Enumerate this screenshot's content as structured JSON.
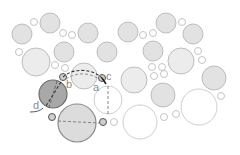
{
  "diagram": {
    "background": "#ffffff",
    "colors": {
      "shaded_fill": "#e2e2e2",
      "shaded_stroke": "#bdbdbd",
      "light_fill": "#ececec",
      "white_fill": "#ffffff",
      "white_stroke": "#cfcfcf",
      "small_stroke": "#c4c4c4",
      "dark_fill": "#a8a8a8",
      "dark_stroke": "#6e6e6e",
      "mid_fill": "#dcdcdc",
      "mid_stroke": "#8c8c8c",
      "path": "#333333"
    },
    "circles": [
      {
        "cx": 22,
        "cy": 34,
        "r": 10,
        "style": "shaded"
      },
      {
        "cx": 50,
        "cy": 23,
        "r": 10,
        "style": "shaded"
      },
      {
        "cx": 88,
        "cy": 33,
        "r": 10,
        "style": "shaded"
      },
      {
        "cx": 128,
        "cy": 32,
        "r": 10,
        "style": "shaded"
      },
      {
        "cx": 166,
        "cy": 23,
        "r": 10,
        "style": "shaded"
      },
      {
        "cx": 193,
        "cy": 34,
        "r": 10,
        "style": "shaded"
      },
      {
        "cx": 64,
        "cy": 52,
        "r": 10,
        "style": "shaded"
      },
      {
        "cx": 107,
        "cy": 52,
        "r": 10,
        "style": "shaded"
      },
      {
        "cx": 153,
        "cy": 51,
        "r": 10,
        "style": "shaded"
      },
      {
        "cx": 214,
        "cy": 78,
        "r": 12,
        "style": "shaded"
      },
      {
        "cx": 163,
        "cy": 95,
        "r": 12,
        "style": "shaded"
      },
      {
        "cx": 36,
        "cy": 62,
        "r": 14,
        "style": "light"
      },
      {
        "cx": 84,
        "cy": 76,
        "r": 13,
        "style": "light"
      },
      {
        "cx": 134,
        "cy": 80,
        "r": 13,
        "style": "light"
      },
      {
        "cx": 181,
        "cy": 61,
        "r": 13,
        "style": "light"
      },
      {
        "cx": 108,
        "cy": 100,
        "r": 14,
        "style": "white"
      },
      {
        "cx": 140,
        "cy": 122,
        "r": 17,
        "style": "white"
      },
      {
        "cx": 199,
        "cy": 107,
        "r": 18,
        "style": "white"
      },
      {
        "cx": 34,
        "cy": 22,
        "r": 3.5,
        "style": "small"
      },
      {
        "cx": 19,
        "cy": 52,
        "r": 3.5,
        "style": "small"
      },
      {
        "cx": 63,
        "cy": 33,
        "r": 3.5,
        "style": "small"
      },
      {
        "cx": 72,
        "cy": 35,
        "r": 3.5,
        "style": "small"
      },
      {
        "cx": 55,
        "cy": 65,
        "r": 3.5,
        "style": "small"
      },
      {
        "cx": 65,
        "cy": 68,
        "r": 3.5,
        "style": "small"
      },
      {
        "cx": 143,
        "cy": 35,
        "r": 3.5,
        "style": "small"
      },
      {
        "cx": 153,
        "cy": 33,
        "r": 3.5,
        "style": "small"
      },
      {
        "cx": 182,
        "cy": 22,
        "r": 3.5,
        "style": "small"
      },
      {
        "cx": 198,
        "cy": 51,
        "r": 3.5,
        "style": "small"
      },
      {
        "cx": 202,
        "cy": 60,
        "r": 3.5,
        "style": "small"
      },
      {
        "cx": 152,
        "cy": 67,
        "r": 3.5,
        "style": "small"
      },
      {
        "cx": 162,
        "cy": 67,
        "r": 3.5,
        "style": "small"
      },
      {
        "cx": 154,
        "cy": 76,
        "r": 3.5,
        "style": "small"
      },
      {
        "cx": 164,
        "cy": 74,
        "r": 3.5,
        "style": "small"
      },
      {
        "cx": 221,
        "cy": 96,
        "r": 3.5,
        "style": "small"
      },
      {
        "cx": 164,
        "cy": 117,
        "r": 3.5,
        "style": "small"
      },
      {
        "cx": 176,
        "cy": 114,
        "r": 3.5,
        "style": "small"
      },
      {
        "cx": 114,
        "cy": 122,
        "r": 3.5,
        "style": "small"
      },
      {
        "cx": 53,
        "cy": 94,
        "r": 14,
        "style": "dark"
      },
      {
        "cx": 77,
        "cy": 123,
        "r": 19,
        "style": "mid"
      },
      {
        "cx": 63,
        "cy": 77,
        "r": 3.5,
        "style": "node"
      },
      {
        "cx": 102,
        "cy": 78,
        "r": 3.5,
        "style": "node"
      },
      {
        "cx": 52,
        "cy": 117,
        "r": 3.5,
        "style": "node"
      },
      {
        "cx": 103,
        "cy": 122,
        "r": 3.5,
        "style": "node"
      }
    ],
    "labels": [
      {
        "id": "a",
        "text": "a",
        "x": 93,
        "y": 91
      },
      {
        "id": "b",
        "text": "b",
        "x": 66,
        "y": 88
      },
      {
        "id": "c",
        "text": "c",
        "x": 106,
        "y": 80
      },
      {
        "id": "d",
        "text": "d",
        "x": 33,
        "y": 109
      }
    ]
  }
}
